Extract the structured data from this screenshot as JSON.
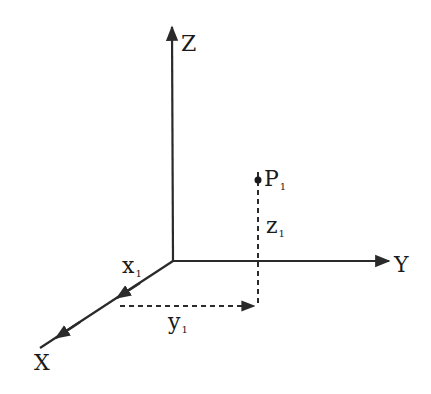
{
  "diagram": {
    "type": "3d-coordinate-axes",
    "axes": {
      "z": {
        "label": "Z"
      },
      "y": {
        "label": "Y"
      },
      "x": {
        "label": "X"
      }
    },
    "point": {
      "label": "P",
      "subscript": "1"
    },
    "components": {
      "x": {
        "label": "x",
        "subscript": "1"
      },
      "y": {
        "label": "y",
        "subscript": "1"
      },
      "z": {
        "label": "z",
        "subscript": "1"
      }
    },
    "colors": {
      "line": "#2a2a2a",
      "background": "#ffffff"
    }
  }
}
